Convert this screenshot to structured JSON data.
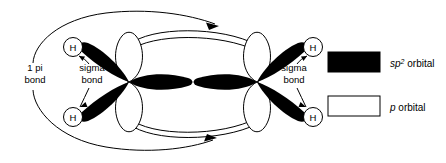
{
  "figure": {
    "background_color": "#ffffff",
    "line_color": "#000000",
    "sp2_fill": "#000000",
    "p_fill": "#ffffff"
  },
  "atoms": {
    "hydrogen_symbol": "H",
    "hydrogen_labels": [
      {
        "id": "h-top-left",
        "text": "H"
      },
      {
        "id": "h-bottom-left",
        "text": "H"
      },
      {
        "id": "h-top-right",
        "text": "H"
      },
      {
        "id": "h-bottom-right",
        "text": "H"
      }
    ]
  },
  "annotations": {
    "pi_bond": {
      "line1": "1 pi",
      "line2": "bond"
    },
    "sigma_bond_left": {
      "line1": "sigma",
      "line2": "bond"
    },
    "sigma_bond_right": {
      "line1": "sigma",
      "line2": "bond"
    }
  },
  "legend": {
    "items": [
      {
        "id": "sp2-orbital",
        "swatch": "filled",
        "symbol": "sp",
        "superscript": "2",
        "suffix": " orbital"
      },
      {
        "id": "p-orbital",
        "swatch": "open",
        "symbol": "p",
        "superscript": "",
        "suffix": " orbital"
      }
    ]
  }
}
